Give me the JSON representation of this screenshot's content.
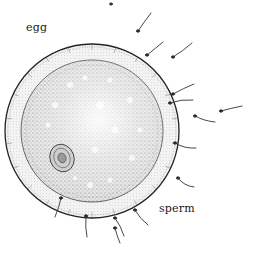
{
  "figure": {
    "labels": {
      "egg": "egg",
      "sperm": "sperm"
    },
    "egg": {
      "center": [
        92,
        131
      ],
      "outer_radius": 87,
      "inner_radius": 71,
      "nucleus_center": [
        62,
        158
      ],
      "colors": {
        "ink": "#1a1a1a",
        "stipple": "#555555",
        "zona": "#eeeeee",
        "cytoplasm": "#d9d9d9"
      }
    },
    "sperm_count": 14
  }
}
